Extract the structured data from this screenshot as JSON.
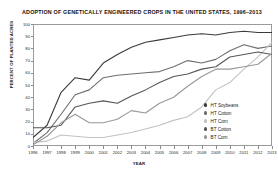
{
  "chart_data": {
    "type": "line",
    "title": "ADOPTION OF GENETICALLY ENGINEERED CROPS IN THE UNITED STATES, 1996–2013",
    "xlabel": "YEAR",
    "ylabel": "PERCENT OF PLANTED ACRES",
    "grid": false,
    "legend_position": "inside-bottom-right",
    "xlim": [
      1996,
      2013
    ],
    "ylim": [
      0,
      100
    ],
    "x": [
      1996,
      1997,
      1998,
      1999,
      2000,
      2001,
      2002,
      2003,
      2004,
      2005,
      2006,
      2007,
      2008,
      2009,
      2010,
      2011,
      2012,
      2013
    ],
    "xticks": [
      "1996",
      "1997",
      "1998",
      "1999",
      "2000",
      "2001",
      "2002",
      "2003",
      "2004",
      "2005",
      "2006",
      "2007",
      "2008",
      "2009",
      "2010",
      "2011",
      "2012",
      "2013"
    ],
    "yticks": [
      "0",
      "10",
      "20",
      "30",
      "40",
      "50",
      "60",
      "70",
      "80",
      "90",
      "100"
    ],
    "series": [
      {
        "name": "HT Soybeans",
        "color": "#3a3a3a",
        "values": [
          7,
          17,
          44,
          56,
          54,
          68,
          75,
          81,
          85,
          87,
          89,
          91,
          92,
          91,
          93,
          94,
          93,
          93
        ]
      },
      {
        "name": "HT Cotton",
        "color": "#6e6e6e",
        "values": [
          2,
          11,
          26,
          42,
          46,
          56,
          58,
          59,
          60,
          61,
          65,
          70,
          68,
          71,
          78,
          83,
          80,
          82
        ]
      },
      {
        "name": "HT Corn",
        "color": "#c2c2c2",
        "values": [
          3,
          4,
          9,
          8,
          7,
          7,
          9,
          11,
          14,
          17,
          21,
          24,
          32,
          46,
          52,
          63,
          73,
          85
        ]
      },
      {
        "name": "BT Cotton",
        "color": "#565656",
        "values": [
          15,
          15,
          17,
          32,
          35,
          37,
          35,
          41,
          46,
          52,
          57,
          59,
          63,
          65,
          73,
          75,
          77,
          75
        ]
      },
      {
        "name": "BT Corn",
        "color": "#989898",
        "values": [
          1,
          8,
          19,
          26,
          19,
          19,
          22,
          29,
          27,
          35,
          40,
          49,
          57,
          63,
          63,
          65,
          67,
          76
        ]
      }
    ]
  },
  "legend": {
    "items": [
      {
        "label": "HT Soybeans",
        "color": "#3a3a3a"
      },
      {
        "label": "HT Cotton",
        "color": "#6e6e6e"
      },
      {
        "label": "HT Corn",
        "color": "#c2c2c2"
      },
      {
        "label": "BT Cotton",
        "color": "#565656"
      },
      {
        "label": "BT Corn",
        "color": "#989898"
      }
    ]
  }
}
